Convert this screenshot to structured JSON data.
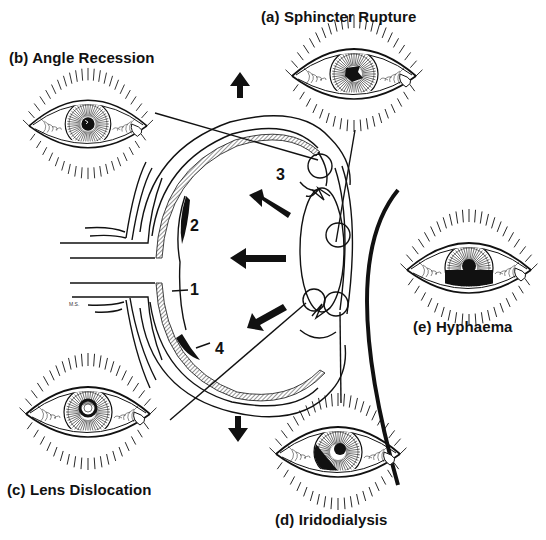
{
  "figure": {
    "panels": [
      {
        "id": "a",
        "label": "(a) Sphincter Rupture",
        "icon": "eye-sphincter-rupture-icon"
      },
      {
        "id": "b",
        "label": "(b) Angle Recession",
        "icon": "eye-angle-recession-icon"
      },
      {
        "id": "c",
        "label": "(c) Lens Dislocation",
        "icon": "eye-lens-dislocation-icon"
      },
      {
        "id": "d",
        "label": "(d) Iridodialysis",
        "icon": "eye-iridodialysis-icon"
      },
      {
        "id": "e",
        "label": "(e) Hyphaema",
        "icon": "eye-hyphaema-icon"
      }
    ],
    "cross_section_markers": [
      "1",
      "2",
      "3",
      "4"
    ],
    "force_arrows": [
      "up",
      "up-left",
      "left",
      "down-left",
      "down"
    ],
    "signature": "M.S."
  }
}
